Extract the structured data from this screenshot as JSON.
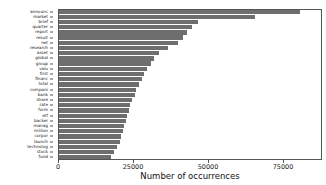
{
  "chart_data": {
    "type": "bar",
    "orientation": "horizontal",
    "title": "",
    "xlabel": "Number of occurrences",
    "ylabel": "",
    "xlim": [
      0,
      88000
    ],
    "ylim": null,
    "grid": false,
    "legend": null,
    "bar_color": "#6e6e6e",
    "background_color": "#ffffff",
    "xticks": [
      0,
      25000,
      50000,
      75000
    ],
    "xticklabels": [
      "0",
      "25000",
      "50000",
      "75000"
    ],
    "categories": [
      "announc",
      "market",
      "brief",
      "quarter",
      "report",
      "result",
      "net",
      "research",
      "asset",
      "global",
      "group",
      "valu",
      "first",
      "financ",
      "total",
      "compani",
      "bank",
      "share",
      "rate",
      "form",
      "etf",
      "backer",
      "manag",
      "million",
      "corpor",
      "launch",
      "technolog",
      "stock",
      "fund"
    ],
    "values": [
      80500,
      65500,
      46500,
      44500,
      43000,
      41500,
      40000,
      36500,
      33500,
      32000,
      31000,
      29500,
      28500,
      28000,
      27000,
      26000,
      25500,
      24500,
      24000,
      23500,
      23000,
      22500,
      22000,
      21500,
      21000,
      20500,
      19500,
      18500,
      17500
    ]
  }
}
